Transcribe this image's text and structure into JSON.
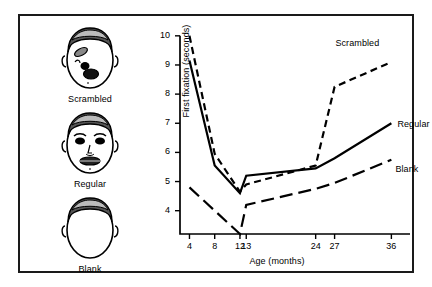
{
  "figure": {
    "stimuli": [
      {
        "id": "scrambled",
        "caption": "Scrambled",
        "icon": "scrambled-face-icon"
      },
      {
        "id": "regular",
        "caption": "Regular",
        "icon": "regular-face-icon"
      },
      {
        "id": "blank",
        "caption": "Blank",
        "icon": "blank-face-icon"
      }
    ]
  },
  "chart_data": {
    "type": "line",
    "title": "",
    "xlabel": "Age (months)",
    "ylabel": "First fixation (seconds)",
    "x": [
      4,
      8,
      12,
      13,
      24,
      27,
      36
    ],
    "xticklabels": [
      "4",
      "8",
      "12",
      "13",
      "24",
      "27",
      "36"
    ],
    "yticks": [
      4,
      5,
      6,
      7,
      8,
      9,
      10
    ],
    "yticklabels": [
      "4",
      "5",
      "6",
      "7",
      "8",
      "9",
      "10"
    ],
    "xlim": [
      2.5,
      38
    ],
    "ylim": [
      3.2,
      10.2
    ],
    "grid": false,
    "legend": "inline-right",
    "series": [
      {
        "name": "Scrambled",
        "linestyle": "dashed",
        "color": "#000000",
        "values": [
          10.0,
          5.95,
          4.65,
          4.9,
          5.55,
          8.25,
          9.1
        ]
      },
      {
        "name": "Regular",
        "linestyle": "solid",
        "color": "#000000",
        "values": [
          9.15,
          5.55,
          4.6,
          5.2,
          5.45,
          5.8,
          7.0
        ]
      },
      {
        "name": "Blank",
        "linestyle": "long-dashed",
        "color": "#000000",
        "values": [
          4.8,
          4.0,
          3.2,
          4.2,
          4.75,
          4.95,
          5.75
        ]
      }
    ]
  }
}
